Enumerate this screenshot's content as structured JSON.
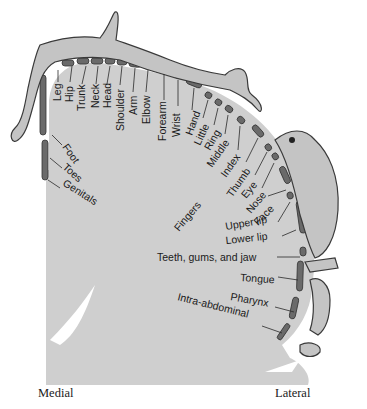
{
  "colors": {
    "cortex_fill": "#cfcfcf",
    "body_fill": "#c4c4c4",
    "outline": "#3a3a3a",
    "segment": "#6a6a6a",
    "text": "#1a1a1a",
    "background": "#ffffff"
  },
  "labels": {
    "leg": "Leg",
    "hip": "Hip",
    "trunk": "Trunk",
    "neck": "Neck",
    "head": "Head",
    "shoulder": "Shoulder",
    "arm": "Arm",
    "elbow": "Elbow",
    "forearm": "Forearm",
    "wrist": "Wrist",
    "hand": "Hand",
    "little": "Little",
    "ring": "Ring",
    "middle": "Middle",
    "index": "Index",
    "thumb": "Thumb",
    "eye": "Eye",
    "nose": "Nose",
    "face": "Face",
    "fingers": "Fingers",
    "upper_lip": "Upper lip",
    "lower_lip": "Lower lip",
    "teeth": "Teeth, gums, and jaw",
    "tongue": "Tongue",
    "pharynx": "Pharynx",
    "intra_abdominal": "Intra-abdominal",
    "foot": "Foot",
    "toes": "Toes",
    "genitals": "Genitals"
  },
  "axis": {
    "medial": "Medial",
    "lateral": "Lateral"
  }
}
